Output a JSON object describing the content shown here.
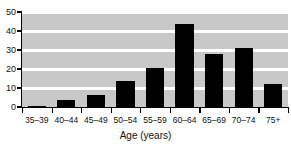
{
  "figure": {
    "clipped_top_text": "",
    "background_color": "#ffffff",
    "plot_band_color": "#c8c8c8",
    "gridline_color": "#ffffff",
    "bar_color": "#000000",
    "axis_color": "#000000"
  },
  "chart_data": {
    "type": "bar",
    "title": "",
    "xlabel": "Age (years)",
    "ylabel": "",
    "categories": [
      "35–39",
      "40–44",
      "45–49",
      "50–54",
      "55–59",
      "60–64",
      "65–69",
      "70–74",
      "75+"
    ],
    "values": [
      0.6,
      3.7,
      6.3,
      13.7,
      20.3,
      43.5,
      28.0,
      31.0,
      12.0
    ],
    "ylim": [
      0,
      50
    ],
    "yticks": [
      0,
      10,
      20,
      30,
      40,
      50
    ],
    "ytick_labels": [
      "0",
      "10",
      "20",
      "30",
      "40",
      "50"
    ],
    "grid": true,
    "grid_axis": "y",
    "legend": false,
    "legend_position": "none",
    "bar_color": "#000000",
    "band_color": "#c8c8c8"
  }
}
